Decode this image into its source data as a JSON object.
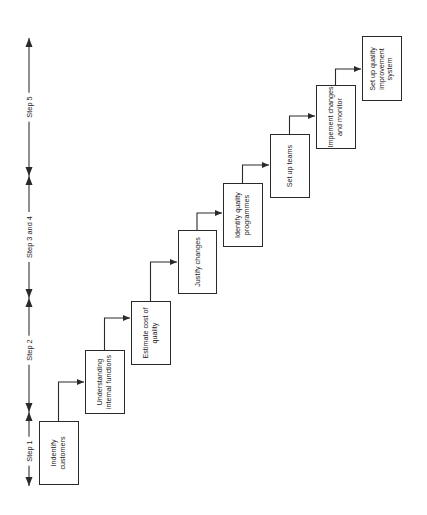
{
  "diagram": {
    "orientation": "rotated-90-ccw",
    "colors": {
      "line": "#2a2a2a",
      "text": "#222222",
      "background": "#ffffff"
    },
    "steps": [
      {
        "id": "step1",
        "label": "Step 1"
      },
      {
        "id": "step2",
        "label": "Step 2"
      },
      {
        "id": "step3_4",
        "label": "Step 3 and 4"
      },
      {
        "id": "step5",
        "label": "Step 5"
      }
    ],
    "boxes": [
      {
        "id": "b1",
        "label": "Indentify customers"
      },
      {
        "id": "b2",
        "label": "Understanding internal functions"
      },
      {
        "id": "b3",
        "label": "Estimate cost of quality"
      },
      {
        "id": "b4",
        "label": "Justify changes"
      },
      {
        "id": "b5",
        "label": "Identify quality programmes"
      },
      {
        "id": "b6",
        "label": "Set up teams"
      },
      {
        "id": "b7",
        "label": "Impement changes and monitor"
      },
      {
        "id": "b8",
        "label": "Set up quality improvement system"
      }
    ]
  }
}
